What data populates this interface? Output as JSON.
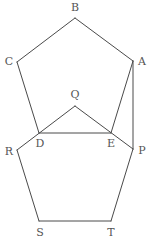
{
  "figure": {
    "stroke_color": "#4a4a4a",
    "label_color": "#555555",
    "background": "#ffffff"
  },
  "points": [
    {
      "id": "A",
      "label": "A"
    },
    {
      "id": "B",
      "label": "B"
    },
    {
      "id": "C",
      "label": "C"
    },
    {
      "id": "D",
      "label": "D"
    },
    {
      "id": "E",
      "label": "E"
    },
    {
      "id": "P",
      "label": "P"
    },
    {
      "id": "Q",
      "label": "Q"
    },
    {
      "id": "R",
      "label": "R"
    },
    {
      "id": "S",
      "label": "S"
    },
    {
      "id": "T",
      "label": "T"
    }
  ],
  "polygons": [
    {
      "name": "pentagon-ABCDE",
      "vertices": [
        "A",
        "B",
        "C",
        "D",
        "E"
      ]
    },
    {
      "name": "pentagon-PQRST",
      "vertices": [
        "P",
        "Q",
        "R",
        "S",
        "T"
      ]
    }
  ],
  "segments": [
    {
      "name": "segment-AP",
      "from": "A",
      "to": "P"
    }
  ]
}
